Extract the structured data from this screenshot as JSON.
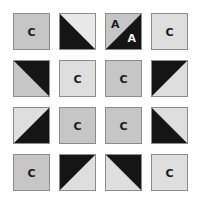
{
  "colors": {
    "gray": "#c6c6c6",
    "light": "#dedede",
    "lighter": "#e8e8e8",
    "black": "#151515",
    "border": "#8c8c8c"
  },
  "grid": {
    "rows": 4,
    "cols": 4,
    "cells": [
      [
        {
          "type": "solid",
          "fill": "gray",
          "letter": "C"
        },
        {
          "type": "split",
          "diagonal": "tl-br",
          "dark_side": "bottom-left",
          "light_fill": "lighter"
        },
        {
          "type": "split-letters",
          "diagonal": "tr-bl",
          "dark_side": "bottom-right",
          "light_fill": "gray",
          "letter_light": "A",
          "letter_dark": "A"
        },
        {
          "type": "solid",
          "fill": "light",
          "letter": "C"
        }
      ],
      [
        {
          "type": "split",
          "diagonal": "tl-br",
          "dark_side": "top-right",
          "light_fill": "gray"
        },
        {
          "type": "solid",
          "fill": "light",
          "letter": "C"
        },
        {
          "type": "solid",
          "fill": "gray",
          "letter": "C"
        },
        {
          "type": "split",
          "diagonal": "tr-bl",
          "dark_side": "top-left",
          "light_fill": "light"
        }
      ],
      [
        {
          "type": "split",
          "diagonal": "tr-bl",
          "dark_side": "bottom-right",
          "light_fill": "light"
        },
        {
          "type": "solid",
          "fill": "gray",
          "letter": "C"
        },
        {
          "type": "solid",
          "fill": "gray",
          "letter": "C"
        },
        {
          "type": "split",
          "diagonal": "tl-br",
          "dark_side": "bottom-left",
          "light_fill": "light"
        }
      ],
      [
        {
          "type": "solid",
          "fill": "gray",
          "letter": "C"
        },
        {
          "type": "split",
          "diagonal": "tr-bl",
          "dark_side": "top-left",
          "light_fill": "light"
        },
        {
          "type": "split",
          "diagonal": "tl-br",
          "dark_side": "top-right",
          "light_fill": "light"
        },
        {
          "type": "solid",
          "fill": "light",
          "letter": "C"
        }
      ]
    ]
  }
}
